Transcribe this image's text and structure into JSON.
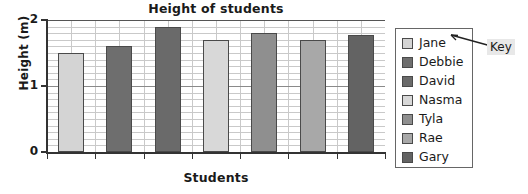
{
  "chart_data": {
    "type": "bar",
    "title": "Height of students",
    "xlabel": "Students",
    "ylabel": "Height (m)",
    "categories": [
      "Jane",
      "Debbie",
      "David",
      "Nasma",
      "Tyla",
      "Rae",
      "Gary"
    ],
    "values": [
      1.5,
      1.6,
      1.9,
      1.7,
      1.8,
      1.7,
      1.78
    ],
    "ylim": [
      0,
      2
    ],
    "ytick_labels": [
      "0",
      "1",
      "2"
    ],
    "ytick_values": [
      0,
      1,
      2
    ],
    "minor_gridline_step": 0.1,
    "grid": true,
    "legend_position": "right",
    "bar_colors": [
      "#d4d4d4",
      "#6e6e6e",
      "#6a6a6a",
      "#d8d8d8",
      "#8f8f8f",
      "#a8a8a8",
      "#636363"
    ]
  },
  "legend": {
    "items": [
      {
        "label": "Jane",
        "color": "#d4d4d4"
      },
      {
        "label": "Debbie",
        "color": "#6e6e6e"
      },
      {
        "label": "David",
        "color": "#6a6a6a"
      },
      {
        "label": "Nasma",
        "color": "#d8d8d8"
      },
      {
        "label": "Tyla",
        "color": "#8f8f8f"
      },
      {
        "label": "Rae",
        "color": "#a8a8a8"
      },
      {
        "label": "Gary",
        "color": "#636363"
      }
    ]
  },
  "annotation": {
    "key_label": "Key"
  }
}
